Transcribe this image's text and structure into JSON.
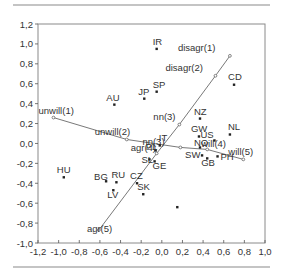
{
  "chart_data": {
    "type": "scatter",
    "title": "",
    "xlabel": "",
    "ylabel": "",
    "xlim": [
      -1.2,
      1.0
    ],
    "ylim": [
      -1.0,
      1.2
    ],
    "grid": false,
    "legend": null,
    "x_ticks": [
      "-1,2",
      "-1,0",
      "-0,8",
      "-0,6",
      "-0,4",
      "-0,2",
      "0,0",
      "0,2",
      "0,4",
      "0,6",
      "0,8",
      "1,0"
    ],
    "x_tick_values": [
      -1.2,
      -1.0,
      -0.8,
      -0.6,
      -0.4,
      -0.2,
      0.0,
      0.2,
      0.4,
      0.6,
      0.8,
      1.0
    ],
    "y_ticks": [
      "1,2",
      "1,0",
      "0,8",
      "0,6",
      "0,4",
      "0,2",
      "0,0",
      "-0,2",
      "-0,4",
      "-0,6",
      "-0,8",
      "-1,0"
    ],
    "y_tick_values": [
      1.2,
      1.0,
      0.8,
      0.6,
      0.4,
      0.2,
      0.0,
      -0.2,
      -0.4,
      -0.6,
      -0.8,
      -1.0
    ],
    "series": [
      {
        "name": "countries",
        "points": [
          {
            "label": "IR",
            "x": -0.05,
            "y": 0.95,
            "lx": -4,
            "ly": -4
          },
          {
            "label": "SP",
            "x": -0.05,
            "y": 0.52,
            "lx": -4,
            "ly": -4
          },
          {
            "label": "JP",
            "x": -0.17,
            "y": 0.45,
            "lx": -6,
            "ly": -4
          },
          {
            "label": "AU",
            "x": -0.46,
            "y": 0.39,
            "lx": -8,
            "ly": -4
          },
          {
            "label": "CD",
            "x": 0.7,
            "y": 0.59,
            "lx": -6,
            "ly": -5
          },
          {
            "label": "NZ",
            "x": 0.37,
            "y": 0.25,
            "lx": -6,
            "ly": -4
          },
          {
            "label": "GW",
            "x": 0.36,
            "y": 0.07,
            "lx": -8,
            "ly": -4
          },
          {
            "label": "NL",
            "x": 0.66,
            "y": 0.09,
            "lx": -2,
            "ly": -4
          },
          {
            "label": "US",
            "x": 0.51,
            "y": 0.03,
            "lx": -14,
            "ly": -2
          },
          {
            "label": "NO",
            "x": 0.37,
            "y": -0.04,
            "lx": -6,
            "ly": -1
          },
          {
            "label": "SW",
            "x": 0.39,
            "y": -0.12,
            "lx": -17,
            "ly": 3
          },
          {
            "label": "GB",
            "x": 0.44,
            "y": -0.15,
            "lx": -6,
            "ly": 8
          },
          {
            "label": "PH",
            "x": 0.54,
            "y": -0.13,
            "lx": 3,
            "ly": 4
          },
          {
            "label": "IT",
            "x": -0.02,
            "y": -0.02,
            "lx": -1,
            "ly": -4
          },
          {
            "label": "PL",
            "x": -0.06,
            "y": -0.07,
            "lx": -10,
            "ly": 0
          },
          {
            "label": "SL",
            "x": -0.12,
            "y": -0.16,
            "lx": -8,
            "ly": 4
          },
          {
            "label": "GE",
            "x": -0.07,
            "y": -0.18,
            "lx": -2,
            "ly": 8
          },
          {
            "label": "HU",
            "x": -0.95,
            "y": -0.34,
            "lx": -7,
            "ly": -4
          },
          {
            "label": "BG",
            "x": -0.54,
            "y": -0.38,
            "lx": -12,
            "ly": -1
          },
          {
            "label": "RU",
            "x": -0.44,
            "y": -0.39,
            "lx": -5,
            "ly": -4
          },
          {
            "label": "LV",
            "x": -0.47,
            "y": -0.47,
            "lx": -6,
            "ly": 8
          },
          {
            "label": "CZ",
            "x": -0.24,
            "y": -0.4,
            "lx": -7,
            "ly": -4
          },
          {
            "label": "SK",
            "x": -0.18,
            "y": -0.51,
            "lx": -6,
            "ly": -4
          },
          {
            "label": "",
            "x": 0.15,
            "y": -0.64,
            "lx": 0,
            "ly": 0
          }
        ]
      }
    ],
    "vector_lines": [
      {
        "name": "disagreement-agreement",
        "points": [
          {
            "label": "disagr(1)",
            "x": 0.66,
            "y": 0.88,
            "lx": -52,
            "ly": -5
          },
          {
            "label": "disagr(2)",
            "x": 0.52,
            "y": 0.68,
            "lx": -50,
            "ly": -5
          },
          {
            "label": "nn(3)",
            "x": 0.17,
            "y": 0.19,
            "lx": -26,
            "ly": -5
          },
          {
            "label": "agr(4)",
            "x": -0.05,
            "y": -0.1,
            "lx": -26,
            "ly": -2
          },
          {
            "label": "agr(5)",
            "x": -0.61,
            "y": -0.87,
            "lx": -12,
            "ly": 2
          }
        ]
      },
      {
        "name": "unwillingness-willingness",
        "points": [
          {
            "label": "unwill(1)",
            "x": -1.05,
            "y": 0.26,
            "lx": -15,
            "ly": -4
          },
          {
            "label": "unwill(2)",
            "x": -0.34,
            "y": 0.04,
            "lx": -32,
            "ly": -4
          },
          {
            "label": "nn(3)",
            "x": 0.18,
            "y": -0.04,
            "lx": -38,
            "ly": -2
          },
          {
            "label": "will(4)",
            "x": 0.44,
            "y": -0.06,
            "lx": -6,
            "ly": -2
          },
          {
            "label": "will(5)",
            "x": 0.79,
            "y": -0.16,
            "lx": -15,
            "ly": -4
          }
        ]
      }
    ]
  },
  "layout": {
    "plot_left": 38,
    "plot_right": 265,
    "plot_top": 24,
    "plot_bottom": 243
  }
}
